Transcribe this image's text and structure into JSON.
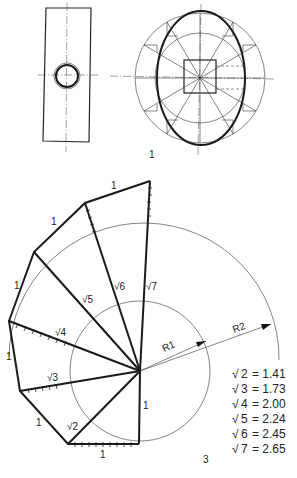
{
  "figure1": {
    "label": "1"
  },
  "figure3": {
    "label": "3",
    "edge_label": "1",
    "radii": {
      "r1": "R1",
      "r2": "R2"
    },
    "hypotenuse_labels": [
      "√2",
      "√3",
      "√4",
      "√5",
      "√6",
      "√7"
    ],
    "table": [
      {
        "radicand": "2",
        "value": "= 1.41"
      },
      {
        "radicand": "3",
        "value": "= 1.73"
      },
      {
        "radicand": "4",
        "value": "= 2.00"
      },
      {
        "radicand": "5",
        "value": "= 2.24"
      },
      {
        "radicand": "6",
        "value": "= 2.45"
      },
      {
        "radicand": "7",
        "value": "= 2.65"
      }
    ]
  }
}
